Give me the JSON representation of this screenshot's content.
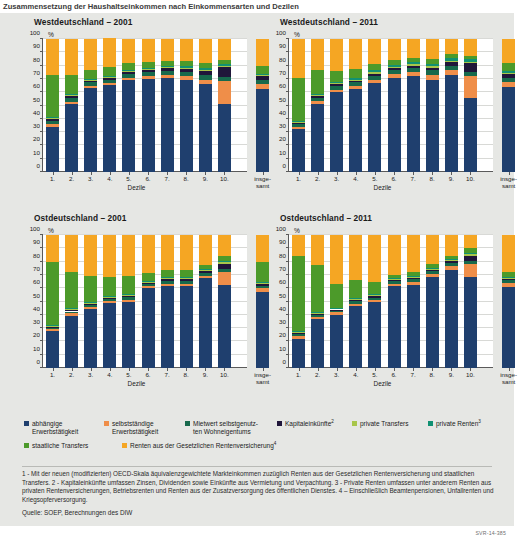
{
  "top_title": "Zusammensetzung der Haushaltseinkommen nach Einkommensarten und Dezilen",
  "axis": {
    "y_unit": "%",
    "y_ticks": [
      0,
      10,
      20,
      30,
      40,
      50,
      60,
      70,
      80,
      90,
      100
    ],
    "x_title": "Dezile",
    "x_ticks": [
      "1.",
      "2.",
      "3.",
      "4.",
      "5.",
      "6.",
      "7.",
      "8.",
      "9.",
      "10."
    ],
    "x_total_line1": "insge-",
    "x_total_line2": "samt"
  },
  "legend": {
    "row1": [
      {
        "label_line1": "abhängige",
        "label_line2": "Erwerbstätigkeit",
        "color": "#1f3f6e",
        "sup": ""
      },
      {
        "label_line1": "selbstständige",
        "label_line2": "Erwerbstätigkeit",
        "color": "#ef8e49",
        "sup": ""
      },
      {
        "label_line1": "Mietwert selbstgenutz-",
        "label_line2": "ten Wohneigentums",
        "color": "#17694c",
        "sup": ""
      },
      {
        "label_line1": "Kapitaleinkünfte",
        "label_line2": "",
        "color": "#20163a",
        "sup": "2"
      },
      {
        "label_line1": "private Transfers",
        "label_line2": "",
        "color": "#a8c64a",
        "sup": ""
      },
      {
        "label_line1": "private Renten",
        "label_line2": "",
        "color": "#119172",
        "sup": "3"
      }
    ],
    "row2": [
      {
        "label_line1": "staatliche Transfers",
        "label_line2": "",
        "color": "#4c9a2a",
        "sup": ""
      },
      {
        "label_line1": "Renten aus der Gesetzlichen Rentenversicherung",
        "label_line2": "",
        "color": "#f5a623",
        "sup": "4"
      }
    ]
  },
  "source": "Quelle: SOEP, Berechnungen des DIW",
  "code": "SVR-14-385",
  "chart_data": {
    "type": "bar",
    "subtype": "stacked-100-percent",
    "title": "Zusammensetzung der Haushaltseinkommen nach Einkommensarten und Dezilen",
    "xlabel": "Dezile",
    "ylabel": "%",
    "ylim": [
      0,
      100
    ],
    "ytick_step": 10,
    "grid": true,
    "legend_position": "bottom",
    "categories": [
      "1.",
      "2.",
      "3.",
      "4.",
      "5.",
      "6.",
      "7.",
      "8.",
      "9.",
      "10.",
      "insgesamt"
    ],
    "series_names": [
      "abhängige Erwerbstätigkeit",
      "selbstständige Erwerbstätigkeit",
      "Mietwert selbstgenutzten Wohneigentums",
      "Kapitaleinkünfte",
      "private Transfers",
      "private Renten",
      "staatliche Transfers",
      "Renten aus der Gesetzlichen Rentenversicherung"
    ],
    "series_colors": [
      "#1f3f6e",
      "#ef8e49",
      "#17694c",
      "#20163a",
      "#a8c64a",
      "#119172",
      "#4c9a2a",
      "#f5a623"
    ],
    "panels": [
      {
        "title": "Westdeutschland – 2001",
        "series": [
          {
            "name": "abhängige Erwerbstätigkeit",
            "values": [
              34,
              51,
              63,
              65.5,
              69,
              70,
              71,
              69.5,
              66,
              51.5,
              62.5
            ]
          },
          {
            "name": "selbstständige Erwerbstätigkeit",
            "values": [
              2,
              2,
              1.5,
              1.5,
              1.5,
              2,
              2,
              2.5,
              3.5,
              17,
              4
            ]
          },
          {
            "name": "Mietwert selbstgenutzten Wohneigentums",
            "values": [
              2.5,
              3,
              3,
              2.5,
              3,
              3,
              3,
              3,
              3.5,
              3,
              3
            ]
          },
          {
            "name": "Kapitaleinkünfte",
            "values": [
              1,
              1,
              1,
              1.5,
              2,
              2,
              2,
              2.5,
              3,
              7.5,
              2.5
            ]
          },
          {
            "name": "private Transfers",
            "values": [
              1,
              1,
              1,
              1,
              1,
              1,
              1,
              1,
              1,
              1,
              1
            ]
          },
          {
            "name": "private Renten",
            "values": [
              0.5,
              0.5,
              0.5,
              0.5,
              0.5,
              0.5,
              1,
              1,
              1,
              1,
              1
            ]
          },
          {
            "name": "staatliche Transfers",
            "values": [
              32,
              14.5,
              7,
              6.5,
              5,
              4,
              3.5,
              4,
              4,
              3,
              6
            ]
          },
          {
            "name": "Renten aus der Gesetzlichen Rentenversicherung",
            "values": [
              27,
              27,
              23,
              21.5,
              18,
              17.5,
              16.5,
              16.5,
              18,
              16,
              20
            ]
          }
        ]
      },
      {
        "title": "Westdeutschland – 2011",
        "series": [
          {
            "name": "abhängige Erwerbstätigkeit",
            "values": [
              32,
              51.5,
              60,
              62.5,
              67,
              71,
              72,
              69.5,
              73,
              56,
              64
            ]
          },
          {
            "name": "selbstständige Erwerbstätigkeit",
            "values": [
              2,
              2,
              2,
              2,
              2.5,
              2.5,
              3,
              3.5,
              3.5,
              16.5,
              4
            ]
          },
          {
            "name": "Mietwert selbstgenutzten Wohneigentums",
            "values": [
              2,
              2.5,
              3,
              3,
              3,
              3,
              3,
              3.5,
              3.5,
              3,
              3
            ]
          },
          {
            "name": "Kapitaleinkünfte",
            "values": [
              1,
              1,
              1,
              1,
              1.5,
              1.5,
              2,
              2,
              2.5,
              6.5,
              2.5
            ]
          },
          {
            "name": "private Transfers",
            "values": [
              1,
              1,
              1,
              1,
              1,
              1,
              1,
              1,
              1,
              1,
              1
            ]
          },
          {
            "name": "private Renten",
            "values": [
              0.5,
              1,
              1,
              1,
              1.5,
              1.5,
              1.5,
              2,
              2,
              2,
              1.5
            ]
          },
          {
            "name": "staatliche Transfers",
            "values": [
              32,
              18,
              8,
              7,
              4.5,
              4,
              3,
              3.5,
              3.5,
              2.5,
              6
            ]
          },
          {
            "name": "Renten aus der Gesetzlichen Rentenversicherung",
            "values": [
              29.5,
              23,
              24,
              22.5,
              19,
              15.5,
              14.5,
              15,
              11,
              12.5,
              18
            ]
          }
        ]
      },
      {
        "title": "Ostdeutschland – 2001",
        "series": [
          {
            "name": "abhängige Erwerbstätigkeit",
            "values": [
              27.5,
              39,
              44,
              49,
              50,
              60,
              61.5,
              61.5,
              67.5,
              62.5,
              57
            ]
          },
          {
            "name": "selbstständige Erwerbstätigkeit",
            "values": [
              1.5,
              2,
              2,
              1.5,
              1.5,
              1.5,
              2,
              2,
              2,
              10,
              3
            ]
          },
          {
            "name": "Mietwert selbstgenutzten Wohneigentums",
            "values": [
              1,
              1.5,
              1.5,
              1.5,
              2,
              1.5,
              2,
              2,
              2,
              2,
              2
            ]
          },
          {
            "name": "Kapitaleinkünfte",
            "values": [
              0.5,
              1,
              1,
              1,
              1,
              1,
              1.5,
              1.5,
              1.5,
              4,
              1.5
            ]
          },
          {
            "name": "private Transfers",
            "values": [
              1,
              1,
              1,
              1,
              1,
              1,
              1,
              1,
              1,
              1,
              1
            ]
          },
          {
            "name": "private Renten",
            "values": [
              0.5,
              0.5,
              0.5,
              0.5,
              0.5,
              0.5,
              0.5,
              0.5,
              0.5,
              1,
              0.5
            ]
          },
          {
            "name": "staatliche Transfers",
            "values": [
              48,
              27.5,
              19,
              14,
              13,
              6,
              5,
              5.5,
              3,
              4,
              15
            ]
          },
          {
            "name": "Renten aus der Gesetzlichen Rentenversicherung",
            "values": [
              20,
              27.5,
              31,
              31.5,
              31,
              28.5,
              26.5,
              26,
              22.5,
              15.5,
              20
            ]
          }
        ]
      },
      {
        "title": "Ostdeutschland – 2011",
        "series": [
          {
            "name": "abhängige Erwerbstätigkeit",
            "values": [
              22,
              37,
              40,
              47,
              49.5,
              61.5,
              62.5,
              68.5,
              74,
              68.5,
              61
            ]
          },
          {
            "name": "selbstständige Erwerbstätigkeit",
            "values": [
              2,
              1.5,
              2,
              1.5,
              1.5,
              2,
              2.5,
              2.5,
              3,
              10,
              3
            ]
          },
          {
            "name": "Mietwert selbstgenutzten Wohneigentums",
            "values": [
              1.5,
              1.5,
              1.5,
              2,
              2,
              2,
              2,
              2,
              2,
              2,
              2
            ]
          },
          {
            "name": "Kapitaleinkünfte",
            "values": [
              0.5,
              0.5,
              0.5,
              1,
              1,
              1,
              1,
              1,
              1.5,
              4,
              1
            ]
          },
          {
            "name": "private Transfers",
            "values": [
              1,
              1,
              1,
              1,
              1,
              1,
              1,
              1,
              1,
              1,
              1
            ]
          },
          {
            "name": "private Renten",
            "values": [
              0.5,
              0.5,
              0.5,
              0.5,
              0.5,
              0.5,
              0.5,
              0.5,
              0.5,
              1,
              0.5
            ]
          },
          {
            "name": "staatliche Transfers",
            "values": [
              57,
              35.5,
              18,
              13,
              9.5,
              2,
              3,
              2.5,
              2.5,
              3.5,
              4
            ]
          },
          {
            "name": "Renten aus der Gesetzlichen Rentenversicherung",
            "values": [
              15.5,
              22.5,
              36.5,
              34,
              35,
              30,
              27.5,
              22,
              15.5,
              10,
              27.5
            ]
          }
        ]
      }
    ]
  }
}
